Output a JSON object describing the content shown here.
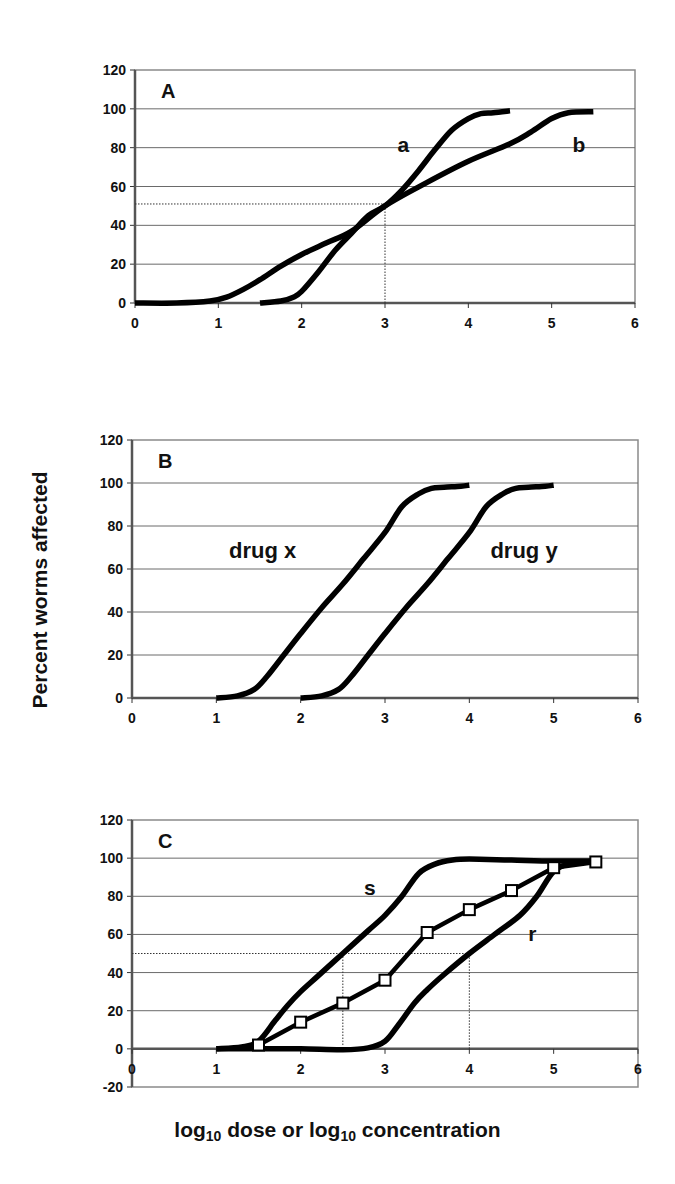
{
  "figure": {
    "ylabel": "Percent worms affected",
    "xlabel_parts": [
      "log",
      "10",
      " dose or log",
      "10",
      " concentration"
    ]
  },
  "chart_data": [
    {
      "type": "line",
      "panel": "A",
      "title": "A",
      "xlabel": "log10 dose or log10 concentration",
      "ylabel": "Percent worms affected",
      "xlim": [
        0,
        6
      ],
      "ylim": [
        0,
        120
      ],
      "xticks": [
        0,
        1,
        2,
        3,
        4,
        5,
        6
      ],
      "yticks": [
        0,
        20,
        40,
        60,
        80,
        100,
        120
      ],
      "grid": true,
      "geom": {
        "x0": 135,
        "x1": 635,
        "ytop": 70,
        "ybot": 303,
        "ymin": 0,
        "ymax": 120
      },
      "series": [
        {
          "name": "a",
          "label_pos": [
            3.15,
            82
          ],
          "x": [
            1.5,
            1.75,
            1.9,
            2.0,
            2.2,
            2.4,
            2.6,
            2.8,
            3.0,
            3.2,
            3.4,
            3.6,
            3.8,
            4.0,
            4.15,
            4.3,
            4.5
          ],
          "y": [
            0,
            1,
            3,
            6,
            16,
            27,
            36,
            45,
            50,
            58,
            68,
            79,
            89,
            95,
            97.5,
            98,
            99
          ]
        },
        {
          "name": "b",
          "label_pos": [
            5.25,
            82
          ],
          "x": [
            0,
            0.5,
            0.9,
            1.1,
            1.3,
            1.5,
            1.75,
            2.0,
            2.3,
            2.6,
            3.0,
            3.5,
            4.0,
            4.5,
            4.75,
            5.0,
            5.2,
            5.5
          ],
          "y": [
            0,
            0,
            1,
            3,
            7,
            12,
            19,
            25,
            31,
            37,
            50,
            62,
            73,
            82,
            88,
            95,
            98,
            98.5
          ]
        }
      ],
      "annotations": [
        {
          "type": "dotted-hline",
          "y": 51,
          "x_from": 0,
          "x_to": 3
        },
        {
          "type": "dotted-vline",
          "x": 3,
          "y_from": 0,
          "y_to": 51
        }
      ]
    },
    {
      "type": "line",
      "panel": "B",
      "title": "B",
      "xlabel": "log10 dose or log10 concentration",
      "ylabel": "Percent worms affected",
      "xlim": [
        0,
        6
      ],
      "ylim": [
        0,
        120
      ],
      "xticks": [
        0,
        1,
        2,
        3,
        4,
        5,
        6
      ],
      "yticks": [
        0,
        20,
        40,
        60,
        80,
        100,
        120
      ],
      "grid": true,
      "geom": {
        "x0": 132,
        "x1": 638,
        "ytop": 440,
        "ybot": 698,
        "ymin": 0,
        "ymax": 120
      },
      "series": [
        {
          "name": "drug x",
          "label_pos": [
            1.15,
            69
          ],
          "x": [
            1.0,
            1.25,
            1.45,
            1.6,
            1.8,
            2.0,
            2.25,
            2.5,
            2.75,
            3.0,
            3.2,
            3.4,
            3.55,
            3.7,
            3.9,
            4.0
          ],
          "y": [
            0,
            1,
            4,
            10,
            20,
            30,
            42,
            53,
            65,
            77,
            89,
            95,
            97.5,
            98,
            98.5,
            99
          ]
        },
        {
          "name": "drug y",
          "label_pos": [
            4.25,
            69
          ],
          "x": [
            2.0,
            2.25,
            2.45,
            2.6,
            2.8,
            3.0,
            3.25,
            3.5,
            3.75,
            4.0,
            4.2,
            4.4,
            4.55,
            4.7,
            4.9,
            5.0
          ],
          "y": [
            0,
            1,
            4,
            10,
            20,
            30,
            42,
            53,
            65,
            77,
            89,
            95,
            97.5,
            98,
            98.5,
            99
          ]
        }
      ],
      "annotations": []
    },
    {
      "type": "line",
      "panel": "C",
      "title": "C",
      "xlabel": "log10 dose or log10 concentration",
      "ylabel": "Percent worms affected",
      "xlim": [
        0,
        6
      ],
      "ylim": [
        -20,
        120
      ],
      "xticks": [
        0,
        1,
        2,
        3,
        4,
        5,
        6
      ],
      "yticks": [
        -20,
        0,
        20,
        40,
        60,
        80,
        100,
        120
      ],
      "grid": true,
      "geom": {
        "x0": 132,
        "x1": 638,
        "ytop": 820,
        "ybot": 1087,
        "ymin": -20,
        "ymax": 120
      },
      "series": [
        {
          "name": "s",
          "label_pos": [
            2.75,
            85
          ],
          "x": [
            1.0,
            1.3,
            1.5,
            1.7,
            1.85,
            2.0,
            2.2,
            2.5,
            2.8,
            3.0,
            3.2,
            3.4,
            3.6,
            3.8,
            4.0,
            4.5,
            5.0,
            5.5
          ],
          "y": [
            0,
            1,
            4,
            15,
            23,
            30,
            38,
            50,
            62,
            70,
            80,
            92,
            97,
            99,
            99.5,
            99,
            98.5,
            98.5
          ]
        },
        {
          "name": "r",
          "label_pos": [
            4.7,
            61
          ],
          "x": [
            1.0,
            1.5,
            2.0,
            2.5,
            2.8,
            3.0,
            3.15,
            3.35,
            3.5,
            3.7,
            4.0,
            4.3,
            4.6,
            4.8,
            5.0,
            5.2,
            5.5
          ],
          "y": [
            0,
            0,
            0,
            -0.5,
            0.5,
            4,
            12,
            24,
            31,
            39,
            50,
            60,
            70,
            80,
            93,
            97,
            98.5
          ]
        },
        {
          "name": "observed",
          "markers": true,
          "x": [
            1.5,
            2.0,
            2.5,
            3.0,
            3.5,
            4.0,
            4.5,
            5.0,
            5.5
          ],
          "y": [
            2,
            14,
            24,
            36,
            61,
            73,
            83,
            95,
            98
          ]
        }
      ],
      "annotations": [
        {
          "type": "dotted-hline",
          "y": 50,
          "x_from": 0,
          "x_to": 4
        },
        {
          "type": "dotted-vline",
          "x": 2.5,
          "y_from": 2,
          "y_to": 50
        },
        {
          "type": "dotted-vline",
          "x": 4,
          "y_from": 0,
          "y_to": 50
        }
      ]
    }
  ]
}
